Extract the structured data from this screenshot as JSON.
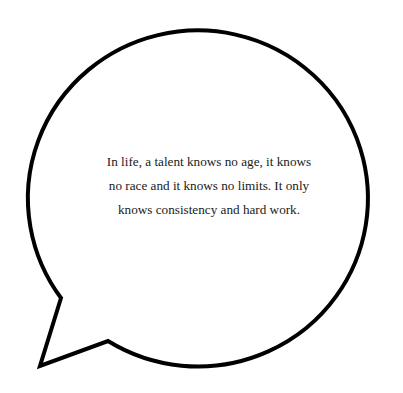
{
  "bubble": {
    "stroke_color": "#000000",
    "fill_color": "#ffffff",
    "quote_text": "In life, a talent knows no age, it knows no race and it knows no limits. It only knows consistency and hard work."
  }
}
